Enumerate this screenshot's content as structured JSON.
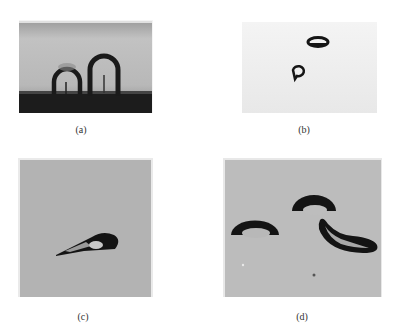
{
  "figure": {
    "panels": [
      {
        "id": "a",
        "label": "(a)",
        "description": "two inverted U-shaped bubbles on dark substrate"
      },
      {
        "id": "b",
        "label": "(b)",
        "description": "two small bubbles on light background"
      },
      {
        "id": "c",
        "label": "(c)",
        "description": "overlapping cap-shaped bubbles"
      },
      {
        "id": "d",
        "label": "(d)",
        "description": "two spherical-cap bubbles and one elongated bubble"
      }
    ],
    "colors": {
      "background": "#ffffff",
      "panel_a_bg": "#b5b5b5",
      "panel_a_floor": "#1c1c1c",
      "panel_b_bg": "#eeeeee",
      "panel_c_bg": "#b3b3b3",
      "panel_d_bg": "#bcbcbc",
      "bubble": "#141414"
    }
  }
}
